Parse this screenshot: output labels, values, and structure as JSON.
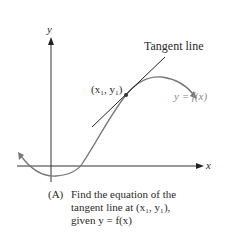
{
  "figure": {
    "axes": {
      "x_label": "x",
      "y_label": "y"
    },
    "labels": {
      "tangent_line": "Tangent line",
      "point": "(x₁, y₁)",
      "function": "y = f(x)"
    },
    "caption": {
      "tag": "(A)",
      "lines": [
        "Find the equation of the",
        "tangent line at (x₁, y₁),",
        "given y = f(x)"
      ]
    },
    "colors": {
      "axis": "#333333",
      "curve": "#777777",
      "tangent": "#222222",
      "text": "#2a2a2a",
      "function_label": "#8a8a8a"
    }
  }
}
